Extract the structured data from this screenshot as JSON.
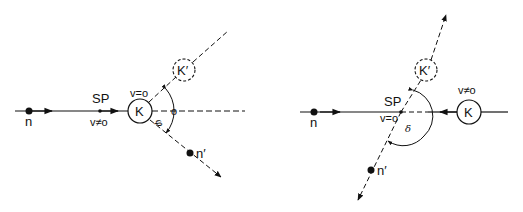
{
  "colors": {
    "ink": "#111111",
    "background": "#ffffff"
  },
  "left_diagram": {
    "neutron_label": "n",
    "scatter_point_label": "SP",
    "incoming_velocity_label": "v≠o",
    "nucleus_label": "K",
    "nucleus_velocity_label": "v=o",
    "recoil_nucleus_label": "K′",
    "scattered_neutron_label": "n′",
    "angle_label": "φ",
    "origin_marker": "o"
  },
  "right_diagram": {
    "neutron_label": "n",
    "scatter_point_label": "SP",
    "scatter_point_velocity_label": "v=o",
    "nucleus_label": "K",
    "nucleus_velocity_label": "v≠o",
    "recoil_nucleus_label": "K′",
    "scattered_neutron_label": "n′",
    "angle_label": "δ"
  }
}
